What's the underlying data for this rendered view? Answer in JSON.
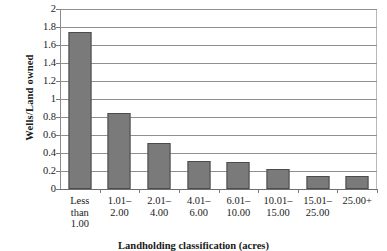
{
  "chart_data": {
    "type": "bar",
    "title": "",
    "xlabel": "Landholding classification (acres)",
    "ylabel": "Wells/Land owned",
    "categories": [
      "Less\nthan\n1.00",
      "1.01–\n2.00",
      "2.01–\n4.00",
      "4.01–\n6.00",
      "6.01–\n10.00",
      "10.01–\n15.00",
      "15.01–\n25.00",
      "25.00+"
    ],
    "values": [
      1.74,
      0.84,
      0.51,
      0.31,
      0.3,
      0.22,
      0.15,
      0.15
    ],
    "ylim": [
      0,
      2
    ],
    "ytick_labels": [
      "2",
      "1.8",
      "1.6",
      "1.4",
      "1.2",
      "1",
      "0.8",
      "0.6",
      "0.4",
      "0.2",
      "0"
    ],
    "ytick_values": [
      2,
      1.8,
      1.6,
      1.4,
      1.2,
      1,
      0.8,
      0.6,
      0.4,
      0.2,
      0
    ],
    "grid": true,
    "legend": "none",
    "colors": {
      "bar_fill": "#7a7a7a",
      "bar_edge": "#4c4c4c",
      "gridline": "#8f8f8f",
      "axis": "#6e6e6e",
      "text": "#1a1a1a",
      "background": "#ffffff"
    }
  }
}
